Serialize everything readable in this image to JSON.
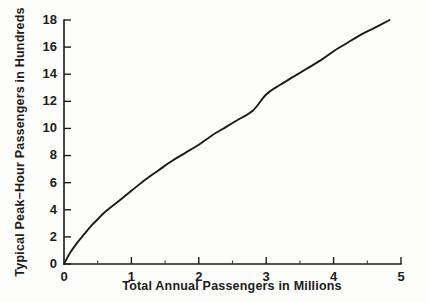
{
  "chart_data": {
    "type": "line",
    "title": "",
    "xlabel": "Total Annual Passengers in Millions",
    "ylabel": "Typical Peak−Hour Passengers in Hundreds",
    "xlim": [
      0,
      5
    ],
    "ylim": [
      0,
      18
    ],
    "xticks": [
      "0",
      "1",
      "2",
      "3",
      "4",
      "5"
    ],
    "xtick_values": [
      0,
      1,
      2,
      3,
      4,
      5
    ],
    "x_minor_tick_values": [
      0.5,
      1.5,
      2.5,
      3.5,
      4.5
    ],
    "yticks": [
      "0",
      "2",
      "4",
      "6",
      "8",
      "10",
      "12",
      "14",
      "16",
      "18"
    ],
    "ytick_values": [
      0,
      2,
      4,
      6,
      8,
      10,
      12,
      14,
      16,
      18
    ],
    "grid": false,
    "legend": "none",
    "series": [
      {
        "name": "Typical peak-hour passengers",
        "x": [
          0.0,
          0.1,
          0.2,
          0.3,
          0.4,
          0.5,
          0.6,
          0.8,
          1.0,
          1.2,
          1.4,
          1.6,
          1.8,
          2.0,
          2.2,
          2.4,
          2.6,
          2.8,
          3.0,
          3.2,
          3.4,
          3.6,
          3.8,
          4.0,
          4.2,
          4.4,
          4.6,
          4.83
        ],
        "y": [
          0.0,
          0.9,
          1.6,
          2.2,
          2.8,
          3.3,
          3.8,
          4.6,
          5.4,
          6.2,
          6.9,
          7.6,
          8.2,
          8.8,
          9.5,
          10.1,
          10.7,
          11.3,
          12.5,
          13.2,
          13.8,
          14.4,
          15.0,
          15.7,
          16.3,
          16.9,
          17.4,
          18.0
        ]
      }
    ],
    "curve_description": "Concave-increasing power curve from the origin to about 4.83 million passengers at 18 hundred peak-hour passengers"
  },
  "figure": {
    "background_color": "#fdfdfc",
    "line_color": "#1a1a1a",
    "axis_color": "#1c1c1c"
  }
}
